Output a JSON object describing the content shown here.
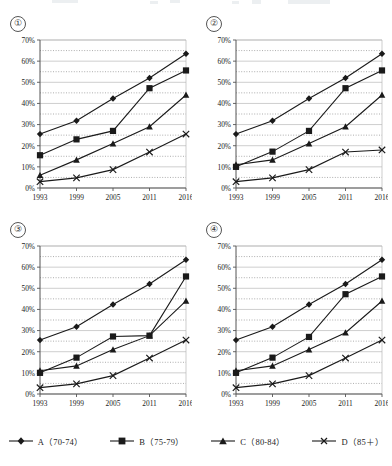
{
  "panels": [
    {
      "id": "panel-1",
      "number": "①"
    },
    {
      "id": "panel-2",
      "number": "②"
    },
    {
      "id": "panel-3",
      "number": "③"
    },
    {
      "id": "panel-4",
      "number": "④"
    }
  ],
  "legend": {
    "position": "bottom-center",
    "items": [
      {
        "key": "A",
        "label": "A（70-74）",
        "marker": "diamond"
      },
      {
        "key": "B",
        "label": "B（75-79）",
        "marker": "square"
      },
      {
        "key": "C",
        "label": "C（80-84）",
        "marker": "triangle"
      },
      {
        "key": "D",
        "label": "D（85＋）",
        "marker": "cross"
      }
    ]
  },
  "axis": {
    "x_ticks": [
      "1993",
      "1999",
      "2005",
      "2011",
      "2016"
    ],
    "y_ticks": [
      "0%",
      "10%",
      "20%",
      "30%",
      "40%",
      "50%",
      "60%",
      "70%"
    ],
    "ylim": [
      0,
      70
    ],
    "grid": "solid major, dotted minor"
  },
  "colors": {
    "line": "#1a1a1a",
    "axis": "#555555",
    "grid_major": "#b8b8b8",
    "grid_minor": "#777777",
    "text": "#222222",
    "background": "#ffffff"
  },
  "chart_data": [
    {
      "type": "line",
      "title": "①",
      "xlabel": "",
      "ylabel": "",
      "x": [
        "1993",
        "1999",
        "2005",
        "2011",
        "2016"
      ],
      "ylim": [
        0,
        70
      ],
      "yticks": [
        0,
        10,
        20,
        30,
        40,
        50,
        60,
        70
      ],
      "series": [
        {
          "name": "A（70-74）",
          "marker": "diamond",
          "values": [
            25.5,
            31.8,
            42.3,
            52.0,
            63.5
          ]
        },
        {
          "name": "B（75-79）",
          "marker": "square",
          "values": [
            15.5,
            23.0,
            27.0,
            47.2,
            55.6
          ]
        },
        {
          "name": "C（80-84）",
          "marker": "triangle",
          "values": [
            6.0,
            13.3,
            21.0,
            29.0,
            44.0
          ]
        },
        {
          "name": "D（85＋）",
          "marker": "cross",
          "values": [
            3.0,
            4.8,
            8.7,
            17.0,
            25.5
          ]
        }
      ]
    },
    {
      "type": "line",
      "title": "②",
      "xlabel": "",
      "ylabel": "",
      "x": [
        "1993",
        "1999",
        "2005",
        "2011",
        "2016"
      ],
      "ylim": [
        0,
        70
      ],
      "yticks": [
        0,
        10,
        20,
        30,
        40,
        50,
        60,
        70
      ],
      "series": [
        {
          "name": "A（70-74）",
          "marker": "diamond",
          "values": [
            25.5,
            31.8,
            42.3,
            52.0,
            63.5
          ]
        },
        {
          "name": "B（75-79）",
          "marker": "square",
          "values": [
            10.0,
            17.2,
            27.0,
            47.2,
            55.6
          ]
        },
        {
          "name": "C（80-84）",
          "marker": "triangle",
          "values": [
            11.0,
            13.3,
            21.0,
            29.0,
            44.0
          ]
        },
        {
          "name": "D（85＋）",
          "marker": "cross",
          "values": [
            3.0,
            4.8,
            8.7,
            17.0,
            18.0
          ]
        }
      ]
    },
    {
      "type": "line",
      "title": "③",
      "xlabel": "",
      "ylabel": "",
      "x": [
        "1993",
        "1999",
        "2005",
        "2011",
        "2016"
      ],
      "ylim": [
        0,
        70
      ],
      "yticks": [
        0,
        10,
        20,
        30,
        40,
        50,
        60,
        70
      ],
      "series": [
        {
          "name": "A（70-74）",
          "marker": "diamond",
          "values": [
            25.5,
            31.8,
            42.3,
            52.0,
            63.5
          ]
        },
        {
          "name": "B（75-79）",
          "marker": "square",
          "values": [
            10.0,
            17.2,
            27.2,
            27.6,
            55.6
          ]
        },
        {
          "name": "C（80-84）",
          "marker": "triangle",
          "values": [
            11.0,
            13.3,
            21.0,
            27.6,
            44.0
          ]
        },
        {
          "name": "D（85＋）",
          "marker": "cross",
          "values": [
            3.0,
            4.8,
            8.7,
            17.0,
            25.5
          ]
        }
      ]
    },
    {
      "type": "line",
      "title": "④",
      "xlabel": "",
      "ylabel": "",
      "x": [
        "1993",
        "1999",
        "2005",
        "2011",
        "2016"
      ],
      "ylim": [
        0,
        70
      ],
      "yticks": [
        0,
        10,
        20,
        30,
        40,
        50,
        60,
        70
      ],
      "series": [
        {
          "name": "A（70-74）",
          "marker": "diamond",
          "values": [
            25.5,
            31.8,
            42.3,
            52.0,
            63.5
          ]
        },
        {
          "name": "B（75-79）",
          "marker": "square",
          "values": [
            10.0,
            17.2,
            27.0,
            47.2,
            55.6
          ]
        },
        {
          "name": "C（80-84）",
          "marker": "triangle",
          "values": [
            11.0,
            13.3,
            21.0,
            29.0,
            44.0
          ]
        },
        {
          "name": "D（85＋）",
          "marker": "cross",
          "values": [
            3.0,
            4.8,
            8.7,
            17.0,
            25.5
          ]
        }
      ]
    }
  ]
}
